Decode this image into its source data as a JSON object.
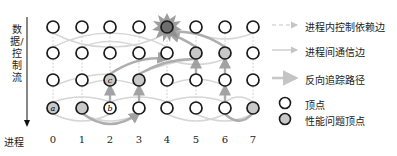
{
  "axis": {
    "vertical_label": "数据/控制流",
    "horizontal_title": "进程",
    "processes": [
      "0",
      "1",
      "2",
      "3",
      "4",
      "5",
      "6",
      "7"
    ]
  },
  "grid": {
    "columns_x": [
      53,
      82,
      110,
      139,
      167,
      196,
      225,
      253
    ],
    "rows_y": [
      27,
      53,
      80,
      108
    ],
    "nodes": [
      {
        "row": 0,
        "col": 0,
        "type": "normal"
      },
      {
        "row": 0,
        "col": 1,
        "type": "normal"
      },
      {
        "row": 0,
        "col": 2,
        "type": "normal"
      },
      {
        "row": 0,
        "col": 3,
        "type": "normal"
      },
      {
        "row": 0,
        "col": 4,
        "type": "root-cause"
      },
      {
        "row": 0,
        "col": 5,
        "type": "normal"
      },
      {
        "row": 0,
        "col": 6,
        "type": "normal"
      },
      {
        "row": 0,
        "col": 7,
        "type": "normal"
      },
      {
        "row": 1,
        "col": 0,
        "type": "normal"
      },
      {
        "row": 1,
        "col": 1,
        "type": "normal"
      },
      {
        "row": 1,
        "col": 2,
        "type": "normal"
      },
      {
        "row": 1,
        "col": 3,
        "type": "normal"
      },
      {
        "row": 1,
        "col": 4,
        "type": "normal"
      },
      {
        "row": 1,
        "col": 5,
        "type": "problem"
      },
      {
        "row": 1,
        "col": 6,
        "type": "problem"
      },
      {
        "row": 1,
        "col": 7,
        "type": "normal"
      },
      {
        "row": 2,
        "col": 0,
        "type": "normal"
      },
      {
        "row": 2,
        "col": 1,
        "type": "normal"
      },
      {
        "row": 2,
        "col": 2,
        "type": "problem",
        "letter": "c"
      },
      {
        "row": 2,
        "col": 3,
        "type": "problem"
      },
      {
        "row": 2,
        "col": 4,
        "type": "normal"
      },
      {
        "row": 2,
        "col": 5,
        "type": "normal"
      },
      {
        "row": 2,
        "col": 6,
        "type": "normal"
      },
      {
        "row": 2,
        "col": 7,
        "type": "normal"
      },
      {
        "row": 3,
        "col": 0,
        "type": "problem",
        "letter": "a"
      },
      {
        "row": 3,
        "col": 1,
        "type": "problem"
      },
      {
        "row": 3,
        "col": 2,
        "type": "normal",
        "letter": "b"
      },
      {
        "row": 3,
        "col": 3,
        "type": "normal"
      },
      {
        "row": 3,
        "col": 4,
        "type": "normal"
      },
      {
        "row": 3,
        "col": 5,
        "type": "normal"
      },
      {
        "row": 3,
        "col": 6,
        "type": "normal"
      },
      {
        "row": 3,
        "col": 7,
        "type": "problem"
      }
    ]
  },
  "legend": {
    "items": [
      {
        "label": "进程内控制依赖边",
        "kind": "dashed-arrow"
      },
      {
        "label": "进程间通信边",
        "kind": "solid-arrow"
      },
      {
        "label": "反向追踪路径",
        "kind": "thick-arrow"
      },
      {
        "label": "顶点",
        "kind": "vertex"
      },
      {
        "label": "性能问题顶点",
        "kind": "problem-vertex"
      }
    ]
  },
  "colors": {
    "node_stroke": "#1a1a1a",
    "problem_fill": "#c8c8c8",
    "root_fill": "#6e6e6e",
    "star_fill": "#8a8a8a",
    "edge_light": "#d4d4d4",
    "path_gray": "#9a9a9a"
  }
}
